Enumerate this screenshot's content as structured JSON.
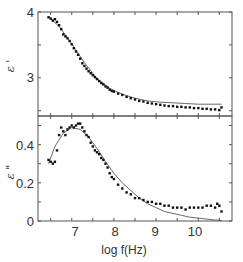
{
  "chart_data": [
    {
      "type": "scatter",
      "panel": "top",
      "xlabel": "log f(Hz)",
      "ylabel": "ε '",
      "xlim": [
        6.2,
        10.8
      ],
      "ylim": [
        2.42,
        4.0
      ],
      "yticks": [
        3,
        4
      ],
      "ytick_labels": [
        "3",
        "4"
      ],
      "xticks": [
        7,
        8,
        9,
        10
      ],
      "grid": false,
      "series": [
        {
          "name": "measured",
          "style": "points",
          "x": [
            6.45,
            6.5,
            6.55,
            6.6,
            6.65,
            6.7,
            6.75,
            6.8,
            6.85,
            6.9,
            6.95,
            7.0,
            7.05,
            7.1,
            7.15,
            7.2,
            7.25,
            7.3,
            7.35,
            7.4,
            7.45,
            7.5,
            7.55,
            7.6,
            7.65,
            7.7,
            7.75,
            7.8,
            7.85,
            7.9,
            7.95,
            8.0,
            8.1,
            8.2,
            8.3,
            8.4,
            8.5,
            8.6,
            8.7,
            8.8,
            8.9,
            9.0,
            9.1,
            9.2,
            9.3,
            9.4,
            9.5,
            9.6,
            9.7,
            9.8,
            9.9,
            10.0,
            10.1,
            10.2,
            10.3,
            10.4,
            10.5,
            10.55
          ],
          "y": [
            3.92,
            3.9,
            3.87,
            3.89,
            3.85,
            3.8,
            3.74,
            3.66,
            3.63,
            3.6,
            3.56,
            3.51,
            3.45,
            3.4,
            3.35,
            3.29,
            3.22,
            3.18,
            3.14,
            3.1,
            3.07,
            3.04,
            3.01,
            2.98,
            2.95,
            2.92,
            2.9,
            2.87,
            2.85,
            2.82,
            2.8,
            2.79,
            2.76,
            2.74,
            2.71,
            2.69,
            2.67,
            2.65,
            2.64,
            2.62,
            2.61,
            2.6,
            2.59,
            2.58,
            2.57,
            2.57,
            2.56,
            2.56,
            2.55,
            2.55,
            2.54,
            2.54,
            2.53,
            2.53,
            2.52,
            2.52,
            2.51,
            2.55
          ]
        },
        {
          "name": "fit",
          "style": "line",
          "x": [
            6.45,
            6.7,
            7.0,
            7.3,
            7.6,
            7.9,
            8.2,
            8.5,
            8.8,
            9.1,
            9.4,
            9.7,
            10.0,
            10.3,
            10.55
          ],
          "y": [
            3.93,
            3.78,
            3.52,
            3.23,
            2.99,
            2.84,
            2.75,
            2.69,
            2.65,
            2.63,
            2.62,
            2.61,
            2.6,
            2.6,
            2.6
          ]
        }
      ]
    },
    {
      "type": "scatter",
      "panel": "bottom",
      "xlabel": "log f(Hz)",
      "ylabel": "ε \"",
      "xlim": [
        6.2,
        10.8
      ],
      "ylim": [
        0,
        0.55
      ],
      "yticks": [
        0,
        0.2,
        0.4
      ],
      "ytick_labels": [
        "0",
        "0.2",
        "0.4"
      ],
      "xticks": [
        7,
        8,
        9,
        10
      ],
      "xtick_labels": [
        "7",
        "8",
        "9",
        "10"
      ],
      "grid": false,
      "series": [
        {
          "name": "measured",
          "style": "points",
          "x": [
            6.45,
            6.5,
            6.55,
            6.6,
            6.65,
            6.7,
            6.75,
            6.8,
            6.85,
            6.9,
            6.95,
            7.0,
            7.05,
            7.1,
            7.15,
            7.2,
            7.25,
            7.3,
            7.35,
            7.4,
            7.45,
            7.5,
            7.55,
            7.6,
            7.65,
            7.7,
            7.75,
            7.8,
            7.85,
            7.9,
            7.95,
            8.0,
            8.1,
            8.2,
            8.3,
            8.4,
            8.5,
            8.6,
            8.7,
            8.8,
            8.9,
            9.0,
            9.1,
            9.2,
            9.3,
            9.4,
            9.5,
            9.6,
            9.7,
            9.8,
            9.9,
            10.0,
            10.1,
            10.2,
            10.3,
            10.4,
            10.45,
            10.5,
            10.55
          ],
          "y": [
            0.32,
            0.31,
            0.3,
            0.31,
            0.37,
            0.45,
            0.49,
            0.47,
            0.45,
            0.48,
            0.49,
            0.5,
            0.49,
            0.5,
            0.51,
            0.51,
            0.49,
            0.47,
            0.45,
            0.44,
            0.41,
            0.39,
            0.37,
            0.36,
            0.35,
            0.33,
            0.32,
            0.3,
            0.28,
            0.25,
            0.23,
            0.22,
            0.19,
            0.17,
            0.15,
            0.14,
            0.12,
            0.12,
            0.11,
            0.1,
            0.1,
            0.09,
            0.09,
            0.08,
            0.08,
            0.07,
            0.07,
            0.07,
            0.06,
            0.07,
            0.07,
            0.07,
            0.07,
            0.08,
            0.08,
            0.07,
            0.09,
            0.08,
            0.05
          ]
        },
        {
          "name": "fit",
          "style": "line",
          "x": [
            6.45,
            6.6,
            6.8,
            7.0,
            7.2,
            7.4,
            7.6,
            7.8,
            8.0,
            8.2,
            8.4,
            8.6,
            8.8,
            9.0,
            9.2,
            9.4,
            9.6,
            9.8,
            10.0,
            10.2,
            10.4,
            10.55
          ],
          "y": [
            0.3,
            0.39,
            0.46,
            0.49,
            0.48,
            0.44,
            0.38,
            0.31,
            0.25,
            0.2,
            0.16,
            0.12,
            0.09,
            0.07,
            0.05,
            0.04,
            0.03,
            0.02,
            0.015,
            0.01,
            0.005,
            0.003
          ]
        }
      ]
    }
  ],
  "labels": {
    "top_ylabel": "ε '",
    "bottom_ylabel": "ε \"",
    "xlabel": "log f(Hz)",
    "top_ticks": [
      "4",
      "3"
    ],
    "bottom_ticks": [
      "0.4",
      "0.2",
      "0"
    ],
    "x_ticks": [
      "7",
      "8",
      "9",
      "10"
    ]
  }
}
